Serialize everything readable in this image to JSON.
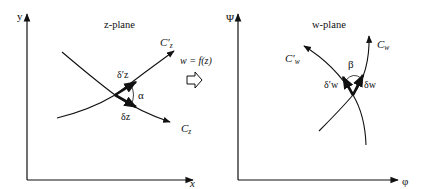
{
  "z_plane": {
    "title": "z-plane",
    "x_axis_label": "x",
    "y_axis_label": "y",
    "curve_c_label": "C",
    "curve_c_sub": "z",
    "curve_cprime_label": "C′",
    "curve_cprime_sub": "z",
    "delta_z_label": "δz",
    "delta_zprime_label": "δ′z",
    "angle_label": "α"
  },
  "mapping": {
    "label": "w = f(z)",
    "arrow_icon": "hollow-right-arrow"
  },
  "w_plane": {
    "title": "w-plane",
    "x_axis_label": "φ",
    "y_axis_label": "Ψ",
    "curve_c_label": "C",
    "curve_c_sub": "w",
    "curve_cprime_label": "C′",
    "curve_cprime_sub": "w",
    "delta_w_label": "δw",
    "delta_wprime_label": "δ′w",
    "angle_label": "β"
  },
  "colors": {
    "ink": "#111111",
    "background": "#ffffff"
  }
}
